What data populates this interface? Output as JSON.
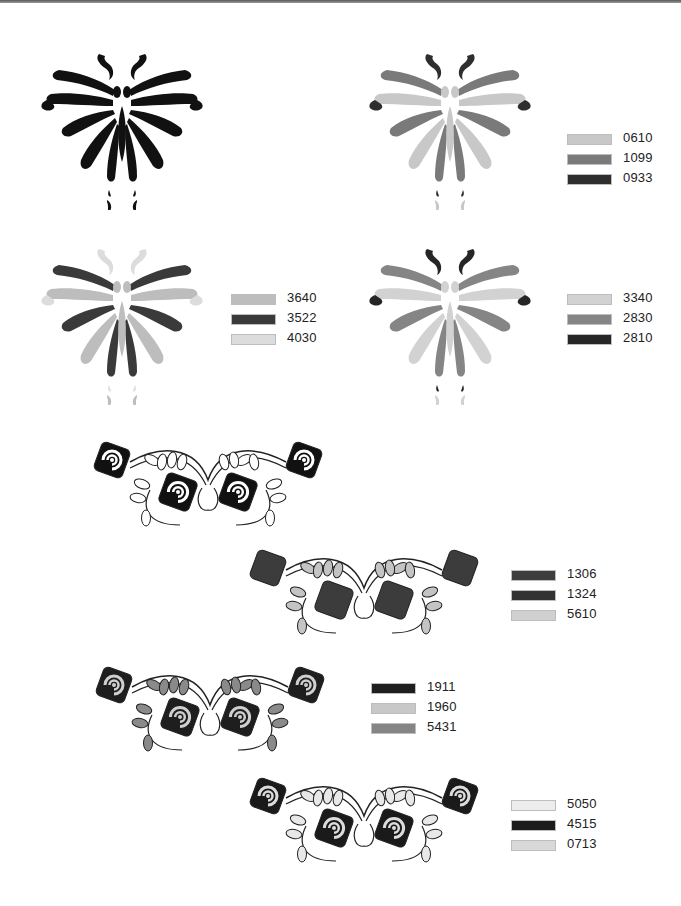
{
  "page": {
    "background": "#ffffff",
    "top_bar_color": "#6a6a6a"
  },
  "butterflies": [
    {
      "name": "butterfly-outline-black",
      "colors": {
        "a": "#111111",
        "b": "#111111",
        "c": "#111111"
      },
      "legend": []
    },
    {
      "name": "butterfly-variant-1",
      "colors": {
        "a": "#c8c8c8",
        "b": "#7a7a7a",
        "c": "#2e2e2e"
      },
      "legend": [
        {
          "code": "0610",
          "color": "#c8c8c8"
        },
        {
          "code": "1099",
          "color": "#7a7a7a"
        },
        {
          "code": "0933",
          "color": "#2e2e2e"
        }
      ]
    },
    {
      "name": "butterfly-variant-2",
      "colors": {
        "a": "#bdbdbd",
        "b": "#3a3a3a",
        "c": "#dcdcdc"
      },
      "legend": [
        {
          "code": "3640",
          "color": "#bdbdbd"
        },
        {
          "code": "3522",
          "color": "#3a3a3a"
        },
        {
          "code": "4030",
          "color": "#dcdcdc"
        }
      ]
    },
    {
      "name": "butterfly-variant-3",
      "colors": {
        "a": "#d2d2d2",
        "b": "#858585",
        "c": "#262626"
      },
      "legend": [
        {
          "code": "3340",
          "color": "#d2d2d2"
        },
        {
          "code": "2830",
          "color": "#858585"
        },
        {
          "code": "2810",
          "color": "#262626"
        }
      ]
    }
  ],
  "roses": [
    {
      "name": "rose-garland-outline",
      "colors": {
        "rose": "#111111",
        "leaf": "#ffffff",
        "petal": "#ffffff"
      },
      "legend": []
    },
    {
      "name": "rose-garland-variant-1",
      "colors": {
        "rose": "#3c3c3c",
        "leaf": "#c4c4c4",
        "petal": "#3c3c3c"
      },
      "legend": [
        {
          "code": "1306",
          "color": "#3e3e3e"
        },
        {
          "code": "1324",
          "color": "#333333"
        },
        {
          "code": "5610",
          "color": "#d0d0d0"
        }
      ]
    },
    {
      "name": "rose-garland-variant-2",
      "colors": {
        "rose": "#1e1e1e",
        "leaf": "#8a8a8a",
        "petal": "#cfcfcf"
      },
      "legend": [
        {
          "code": "1911",
          "color": "#1e1e1e"
        },
        {
          "code": "1960",
          "color": "#c8c8c8"
        },
        {
          "code": "5431",
          "color": "#858585"
        }
      ]
    },
    {
      "name": "rose-garland-variant-3",
      "colors": {
        "rose": "#1a1a1a",
        "leaf": "#e8e8e8",
        "petal": "#dcdcdc"
      },
      "legend": [
        {
          "code": "5050",
          "color": "#ededed"
        },
        {
          "code": "4515",
          "color": "#1c1c1c"
        },
        {
          "code": "0713",
          "color": "#d8d8d8"
        }
      ]
    }
  ]
}
